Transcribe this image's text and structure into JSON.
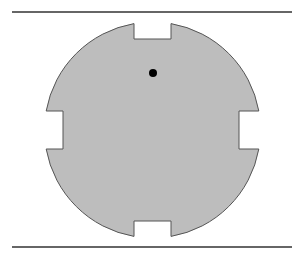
{
  "diagram": {
    "colors": {
      "background": "#ffffff",
      "disk_fill": "#bdbdbd",
      "disk_stroke": "#555555",
      "line": "#333333",
      "dot": "#000000"
    },
    "top_line": {
      "x1": 12,
      "x2": 292,
      "y": 12
    },
    "bottom_line": {
      "x1": 12,
      "x2": 292,
      "y": 247
    },
    "disk": {
      "cx": 152.5,
      "cy": 130,
      "r": 108
    },
    "notches": {
      "top": {
        "x1": 134,
        "x2": 171,
        "depth_to_y": 39
      },
      "bottom": {
        "x1": 134,
        "x2": 171,
        "depth_to_y": 221
      },
      "left": {
        "y1": 111,
        "y2": 149,
        "depth_to_x": 63
      },
      "right": {
        "y1": 111,
        "y2": 149,
        "depth_to_x": 239
      }
    },
    "dot": {
      "cx": 153,
      "cy": 73,
      "r": 4
    }
  }
}
